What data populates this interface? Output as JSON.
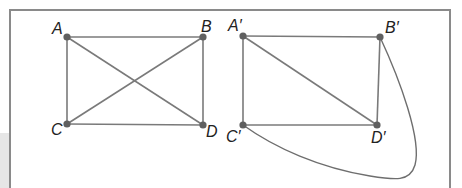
{
  "figure": {
    "left_graph": {
      "vertices": [
        {
          "id": "A",
          "label": "A",
          "x": 67,
          "y": 37
        },
        {
          "id": "B",
          "label": "B",
          "x": 203,
          "y": 37
        },
        {
          "id": "C",
          "label": "C",
          "x": 67,
          "y": 124
        },
        {
          "id": "D",
          "label": "D",
          "x": 203,
          "y": 125
        }
      ],
      "edges": [
        [
          "A",
          "B"
        ],
        [
          "A",
          "C"
        ],
        [
          "B",
          "D"
        ],
        [
          "C",
          "D"
        ],
        [
          "A",
          "D"
        ],
        [
          "B",
          "C"
        ]
      ]
    },
    "right_graph": {
      "vertices": [
        {
          "id": "A'",
          "label": "A′",
          "x": 243,
          "y": 36
        },
        {
          "id": "B'",
          "label": "B′",
          "x": 380,
          "y": 37
        },
        {
          "id": "C'",
          "label": "C′",
          "x": 243,
          "y": 125
        },
        {
          "id": "D'",
          "label": "D′",
          "x": 377,
          "y": 125
        }
      ],
      "edges": [
        [
          "A'",
          "B'"
        ],
        [
          "A'",
          "C'"
        ],
        [
          "B'",
          "D'"
        ],
        [
          "C'",
          "D'"
        ],
        [
          "A'",
          "D'"
        ]
      ],
      "curved_edges": [
        [
          "B'",
          "C'"
        ]
      ]
    },
    "colors": {
      "edge": "#7a7a7a",
      "vertex": "#606060",
      "frame": "#8a8a8a",
      "label": "#222222"
    }
  }
}
